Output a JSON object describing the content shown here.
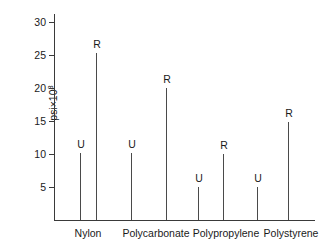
{
  "chart_data": {
    "type": "bar",
    "title": "",
    "subtitle": "",
    "xlabel": "",
    "ylabel": "psi×10³",
    "ylabel_base": "psi×10",
    "ylabel_exp": "3",
    "ylim": [
      0,
      31.5
    ],
    "yticks": [
      5,
      10,
      15,
      20,
      25,
      30
    ],
    "ytick_labels": [
      "5",
      "10",
      "15",
      "20",
      "25",
      "30"
    ],
    "grid": false,
    "legend": "none",
    "series_note": "Each category has two stems labeled U (unreinforced) and R (reinforced)",
    "categories": [
      "Nylon",
      "Polycarbonate",
      "Polypropylene",
      "Polystyrene"
    ],
    "series": [
      {
        "name": "U",
        "values": [
          10.2,
          10.2,
          5.0,
          5.0
        ]
      },
      {
        "name": "R",
        "values": [
          25.3,
          20.0,
          10.0,
          14.9
        ]
      }
    ],
    "points": [
      {
        "category": "Nylon",
        "label": "U",
        "value": 10.2
      },
      {
        "category": "Nylon",
        "label": "R",
        "value": 25.3
      },
      {
        "category": "Polycarbonate",
        "label": "U",
        "value": 10.2
      },
      {
        "category": "Polycarbonate",
        "label": "R",
        "value": 20.0
      },
      {
        "category": "Polypropylene",
        "label": "U",
        "value": 5.0
      },
      {
        "category": "Polypropylene",
        "label": "R",
        "value": 10.0
      },
      {
        "category": "Polystyrene",
        "label": "U",
        "value": 5.0
      },
      {
        "category": "Polystyrene",
        "label": "R",
        "value": 14.9
      }
    ],
    "colors": {
      "axis": "#3a3a3a",
      "stem": "#4a4a4a",
      "text": "#1a1a1a",
      "background": "#ffffff"
    }
  },
  "axis": {
    "y_label_text": "psi×10",
    "y_label_exponent": "3",
    "ticks": [
      {
        "label": "30",
        "value": 30
      },
      {
        "label": "25",
        "value": 25
      },
      {
        "label": "20",
        "value": 20
      },
      {
        "label": "15",
        "value": 15
      },
      {
        "label": "10",
        "value": 10
      },
      {
        "label": "5",
        "value": 5
      }
    ]
  },
  "categories": [
    {
      "label": "Nylon"
    },
    {
      "label": "Polycarbonate"
    },
    {
      "label": "Polypropylene"
    },
    {
      "label": "Polystyrene"
    }
  ],
  "stems": [
    {
      "label": "U",
      "value": 10.2,
      "x": 80
    },
    {
      "label": "R",
      "value": 25.3,
      "x": 96
    },
    {
      "label": "U",
      "value": 10.2,
      "x": 131
    },
    {
      "label": "R",
      "value": 20.0,
      "x": 166
    },
    {
      "label": "U",
      "value": 5.0,
      "x": 198
    },
    {
      "label": "R",
      "value": 10.0,
      "x": 223
    },
    {
      "label": "U",
      "value": 5.0,
      "x": 257
    },
    {
      "label": "R",
      "value": 14.9,
      "x": 288
    }
  ]
}
